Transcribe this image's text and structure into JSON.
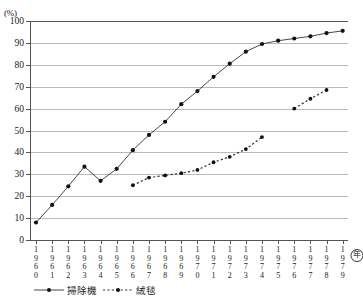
{
  "chart_data": {
    "type": "line",
    "title": "",
    "xlabel": "(年)",
    "ylabel": "(%)",
    "ylim": [
      0,
      100
    ],
    "ytick_step": 10,
    "yticks": [
      "0",
      "10",
      "20",
      "30",
      "40",
      "50",
      "60",
      "70",
      "80",
      "90",
      "100"
    ],
    "grid": true,
    "legend_position": "bottom-left",
    "categories": [
      "1960",
      "1961",
      "1962",
      "1963",
      "1964",
      "1965",
      "1966",
      "1967",
      "1968",
      "1969",
      "1970",
      "1971",
      "1972",
      "1973",
      "1974",
      "1975",
      "1976",
      "1977",
      "1978",
      "1979"
    ],
    "series": [
      {
        "name": "掃除機",
        "style": "solid",
        "marker": "square",
        "values": [
          8,
          16,
          24.5,
          33.5,
          27,
          32.5,
          41,
          48,
          54,
          62,
          68,
          74.5,
          80.5,
          86,
          89.5,
          91,
          92,
          93,
          94.5,
          95.5
        ]
      },
      {
        "name": "絨毯",
        "style": "dashed",
        "marker": "circle",
        "values": [
          null,
          null,
          null,
          null,
          null,
          null,
          25,
          28.5,
          29.5,
          30.5,
          32,
          35.5,
          38,
          41.5,
          47,
          null,
          60,
          64.5,
          68.5,
          null
        ]
      }
    ]
  },
  "axis": {
    "y_unit_label": "(%)",
    "x_unit_label": "年"
  },
  "legend": {
    "items": [
      {
        "label": "掃除機",
        "style": "solid"
      },
      {
        "label": "絨毯",
        "style": "dashed"
      }
    ]
  }
}
